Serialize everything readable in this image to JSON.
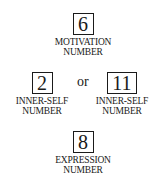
{
  "diagram": {
    "motivation": {
      "value": "6",
      "label_line1": "MOTIVATION",
      "label_line2": "NUMBER"
    },
    "inner_self_a": {
      "value": "2",
      "label_line1": "INNER-SELF",
      "label_line2": "NUMBER"
    },
    "connector": "or",
    "inner_self_b": {
      "value": "11",
      "label_line1": "INNER-SELF",
      "label_line2": "NUMBER"
    },
    "expression": {
      "value": "8",
      "label_line1": "EXPRESSION",
      "label_line2": "NUMBER"
    }
  }
}
